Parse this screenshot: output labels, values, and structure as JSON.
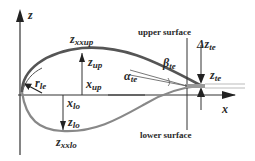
{
  "diagram": {
    "axes": {
      "z_label": "z",
      "x_label": "x"
    },
    "labels": {
      "zxxup": {
        "main": "z",
        "sub": "xxup"
      },
      "zup": {
        "main": "z",
        "sub": "up"
      },
      "xup": {
        "main": "x",
        "sub": "up"
      },
      "rle": {
        "main": "r",
        "sub": "le"
      },
      "xlo": {
        "main": "x",
        "sub": "lo"
      },
      "zlo": {
        "main": "z",
        "sub": "lo"
      },
      "zxxlo": {
        "main": "z",
        "sub": "xxlo"
      },
      "alpha": {
        "main": "α",
        "sub": "te"
      },
      "beta": {
        "main": "β",
        "sub": "te"
      },
      "dzte": {
        "main": "Δz",
        "sub": "te"
      },
      "zte": {
        "main": "z",
        "sub": "te"
      },
      "upper_surface": "upper surface",
      "lower_surface": "lower surface"
    },
    "colors": {
      "upper_curve": "#555555",
      "lower_curve": "#888888",
      "axes": "#333333"
    }
  }
}
